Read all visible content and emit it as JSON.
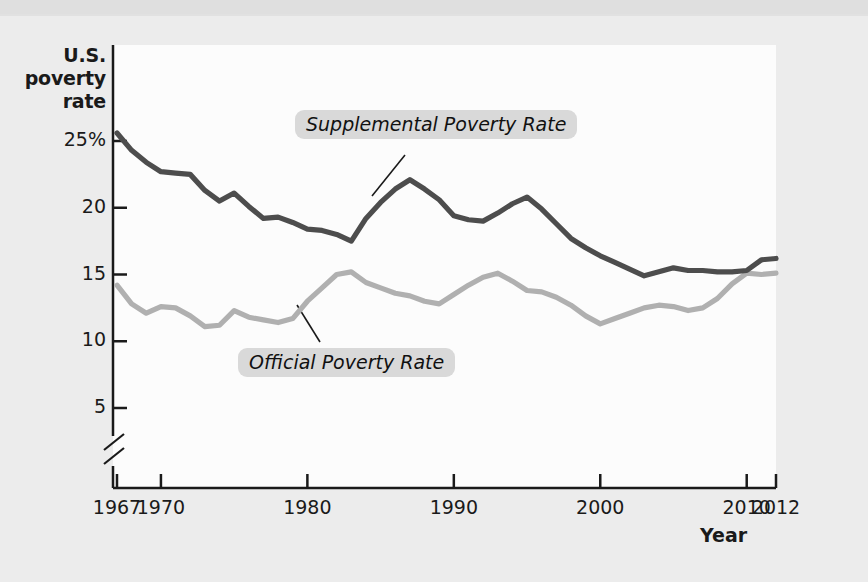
{
  "chart_data": {
    "type": "line",
    "title": "",
    "xlabel": "Year",
    "ylabel": "U.S. poverty rate",
    "xlim": [
      1967,
      2012
    ],
    "ylim": [
      3.5,
      26.5
    ],
    "y_axis_break": true,
    "grid": false,
    "legend_position": "inline-annotation",
    "y_ticks": [
      {
        "value": 25,
        "label": "25%"
      },
      {
        "value": 20,
        "label": "20"
      },
      {
        "value": 15,
        "label": "15"
      },
      {
        "value": 10,
        "label": "10"
      },
      {
        "value": 5,
        "label": "5"
      }
    ],
    "x_ticks": [
      {
        "value": 1967,
        "label": "1967"
      },
      {
        "value": 1970,
        "label": "1970"
      },
      {
        "value": 1980,
        "label": "1980"
      },
      {
        "value": 1990,
        "label": "1990"
      },
      {
        "value": 2000,
        "label": "2000"
      },
      {
        "value": 2010,
        "label": "2010"
      },
      {
        "value": 2012,
        "label": "2012"
      }
    ],
    "x": [
      1967,
      1968,
      1969,
      1970,
      1971,
      1972,
      1973,
      1974,
      1975,
      1976,
      1977,
      1978,
      1979,
      1980,
      1981,
      1982,
      1983,
      1984,
      1985,
      1986,
      1987,
      1988,
      1989,
      1990,
      1991,
      1992,
      1993,
      1994,
      1995,
      1996,
      1997,
      1998,
      1999,
      2000,
      2001,
      2002,
      2003,
      2004,
      2005,
      2006,
      2007,
      2008,
      2009,
      2010,
      2011,
      2012
    ],
    "series": [
      {
        "name": "Supplemental Poverty Rate",
        "color": "#4d4d4d",
        "values": [
          25.6,
          24.3,
          23.4,
          22.7,
          22.6,
          22.5,
          21.3,
          20.5,
          21.1,
          20.1,
          19.2,
          19.3,
          18.9,
          18.4,
          18.3,
          18.0,
          17.5,
          19.2,
          20.4,
          21.4,
          22.1,
          21.4,
          20.6,
          19.4,
          19.1,
          19.0,
          19.6,
          20.3,
          20.8,
          19.9,
          18.8,
          17.7,
          17.0,
          16.4,
          15.9,
          15.4,
          14.9,
          15.2,
          15.5,
          15.3,
          15.3,
          15.2,
          15.2,
          15.3,
          16.1,
          16.2
        ]
      },
      {
        "name": "Official Poverty Rate",
        "color": "#b0b0b0",
        "values": [
          14.2,
          12.8,
          12.1,
          12.6,
          12.5,
          11.9,
          11.1,
          11.2,
          12.3,
          11.8,
          11.6,
          11.4,
          11.7,
          13.0,
          14.0,
          15.0,
          15.2,
          14.4,
          14.0,
          13.6,
          13.4,
          13.0,
          12.8,
          13.5,
          14.2,
          14.8,
          15.1,
          14.5,
          13.8,
          13.7,
          13.3,
          12.7,
          11.9,
          11.3,
          11.7,
          12.1,
          12.5,
          12.7,
          12.6,
          12.3,
          12.5,
          13.2,
          14.3,
          15.1,
          15.0,
          15.1
        ]
      }
    ],
    "annotations": [
      {
        "name": "supplemental-label",
        "text": "Supplemental Poverty Rate",
        "points_to_year": 1985
      },
      {
        "name": "official-label",
        "text": "Official Poverty Rate",
        "points_to_year": 1980
      }
    ],
    "colors": {
      "supplemental": "#4d4d4d",
      "official": "#b0b0b0",
      "axis": "#1a1a1a",
      "plot_background": "#fcfcfc",
      "figure_background": "#ececec",
      "label_background": "#d9d9d9"
    }
  },
  "axis": {
    "y_title_line1": "U.S.",
    "y_title_line2": "poverty",
    "y_title_line3": "rate",
    "x_title": "Year"
  }
}
